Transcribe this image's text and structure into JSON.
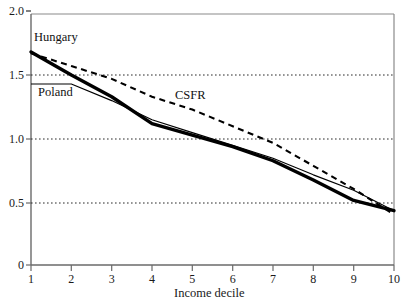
{
  "chart_data": {
    "type": "line",
    "title": "",
    "subtitle": "",
    "xlabel": "Income decile",
    "ylabel": "",
    "xlim": [
      1,
      10
    ],
    "ylim": [
      0,
      2.0
    ],
    "grid": "horizontal dotted at 0.5, 1.0, 1.5",
    "legend_position": "inline annotations on curves",
    "x_ticks": [
      "1",
      "2",
      "3",
      "4",
      "5",
      "6",
      "7",
      "8",
      "9",
      "10"
    ],
    "y_ticks": [
      "0",
      "0.5",
      "1.0",
      "1.5",
      "2.0"
    ],
    "x": [
      1,
      2,
      3,
      4,
      5,
      6,
      7,
      8,
      9,
      10
    ],
    "series": [
      {
        "name": "Hungary",
        "style": "thick-solid",
        "color": "#000000",
        "values": [
          1.68,
          1.5,
          1.33,
          1.12,
          1.03,
          0.94,
          0.83,
          0.68,
          0.52,
          0.44
        ]
      },
      {
        "name": "Poland",
        "style": "thin-solid",
        "color": "#000000",
        "values": [
          1.43,
          1.43,
          1.3,
          1.15,
          1.05,
          0.95,
          0.85,
          0.72,
          0.6,
          0.44
        ]
      },
      {
        "name": "CSFR",
        "style": "dashed",
        "color": "#000000",
        "values": [
          1.67,
          1.57,
          1.47,
          1.33,
          1.23,
          1.1,
          0.97,
          0.79,
          0.61,
          0.41
        ]
      }
    ],
    "annotations": [
      {
        "text": "Hungary",
        "x": 1.15,
        "y": 1.82
      },
      {
        "text": "Poland",
        "x": 1.25,
        "y": 1.33
      },
      {
        "text": "CSFR",
        "x": 5.2,
        "y": 1.33
      }
    ]
  }
}
